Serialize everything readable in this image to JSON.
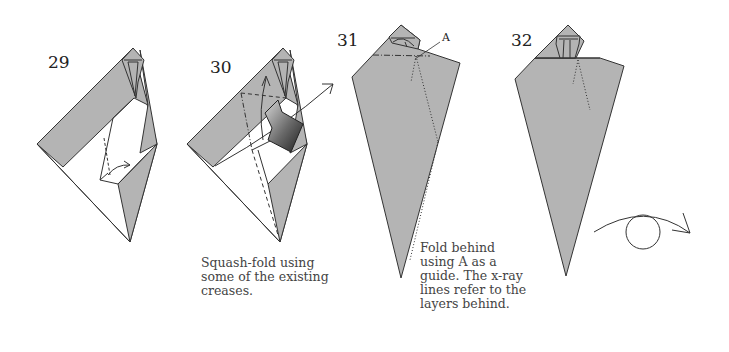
{
  "colors": {
    "paper_gray": "#b4b4b4",
    "line": "#333333",
    "background": "#ffffff",
    "arrow_dark": "#2a2a2a"
  },
  "steps": [
    {
      "number": "29",
      "caption": []
    },
    {
      "number": "30",
      "caption": [
        "Squash-fold using",
        "some of the existing",
        "creases."
      ]
    },
    {
      "number": "31",
      "caption": [
        "Fold behind",
        "using A as a",
        "guide. The x-ray",
        "lines refer to the",
        "layers behind."
      ],
      "reference_label": "A"
    },
    {
      "number": "32",
      "caption": []
    }
  ],
  "symbols": {
    "turn_over": "turn-over-arrow"
  }
}
